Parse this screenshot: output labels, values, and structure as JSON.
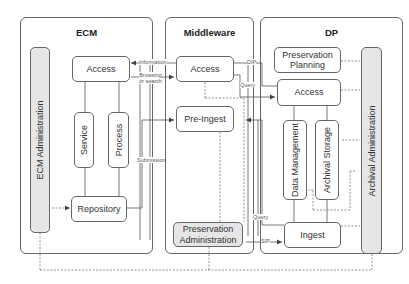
{
  "panels": {
    "ecm": {
      "title": "ECM"
    },
    "middleware": {
      "title": "Middleware"
    },
    "dp": {
      "title": "DP"
    }
  },
  "ecm": {
    "administration": "ECM Administration",
    "access": "Access",
    "service": "Service",
    "process": "Process",
    "repository": "Repository"
  },
  "middleware": {
    "access": "Access",
    "pre_ingest": "Pre-Ingest",
    "preservation_administration_line1": "Preservation",
    "preservation_administration_line2": "Administration"
  },
  "dp": {
    "preservation_planning_line1": "Preservation",
    "preservation_planning_line2": "Planning",
    "access": "Access",
    "data_management": "Data Management",
    "archival_storage": "Archival Storage",
    "ingest": "Ingest",
    "archival_administration": "Archival Administration"
  },
  "flow_labels": {
    "information": "Information",
    "browsing_line1": "Browsing",
    "browsing_line2": "or search",
    "submission": "Submission",
    "dip": "DIP",
    "query_top": "Query",
    "query_bottom": "Query",
    "sip": "SIP"
  },
  "colors": {
    "line": "#555555",
    "admin_fill": "#e6e6e6",
    "border": "#666666"
  }
}
